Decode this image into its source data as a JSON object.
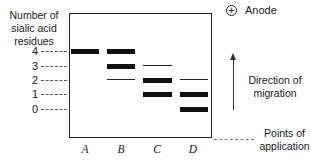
{
  "figure": {
    "y_axis_label": "Number of sialic acid residues",
    "y_ticks": [
      "4",
      "3",
      "2",
      "1",
      "0"
    ],
    "lanes": [
      "A",
      "B",
      "C",
      "D"
    ],
    "anode_symbol": "+",
    "anode_label": "Anode",
    "direction_label": "Direction of migration",
    "points_label": "Points of application",
    "bands": {
      "A": [
        {
          "residues": 4,
          "intensity": "strong"
        }
      ],
      "B": [
        {
          "residues": 4,
          "intensity": "strong"
        },
        {
          "residues": 3,
          "intensity": "strong"
        },
        {
          "residues": 2,
          "intensity": "weak"
        }
      ],
      "C": [
        {
          "residues": 3,
          "intensity": "weak"
        },
        {
          "residues": 2,
          "intensity": "strong"
        },
        {
          "residues": 1,
          "intensity": "strong"
        }
      ],
      "D": [
        {
          "residues": 2,
          "intensity": "weak"
        },
        {
          "residues": 1,
          "intensity": "strong"
        },
        {
          "residues": 0,
          "intensity": "strong"
        }
      ]
    }
  }
}
